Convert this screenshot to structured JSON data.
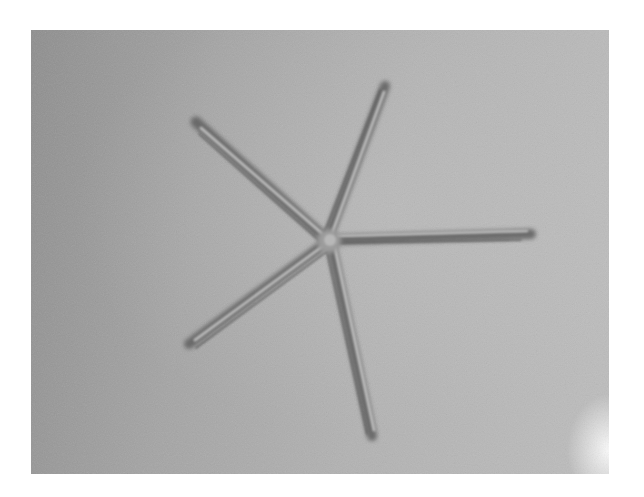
{
  "image": {
    "description": "Grayscale photo of a five-armed brittle-star-like shape on a gray textured surface",
    "colors": {
      "background_dark": "#8e8e8e",
      "background_light": "#bdbdbd",
      "arm_shadow": "#5a5a5a",
      "arm_highlight": "#c8c8c8",
      "page": "#ffffff"
    },
    "subject": {
      "center": [
        296,
        210
      ],
      "arms": [
        {
          "name": "upper-left",
          "tip": [
            165,
            90
          ]
        },
        {
          "name": "top",
          "tip": [
            354,
            55
          ]
        },
        {
          "name": "right",
          "tip": [
            501,
            203
          ]
        },
        {
          "name": "lower-left",
          "tip": [
            157,
            315
          ]
        },
        {
          "name": "bottom",
          "tip": [
            341,
            408
          ]
        }
      ]
    }
  }
}
